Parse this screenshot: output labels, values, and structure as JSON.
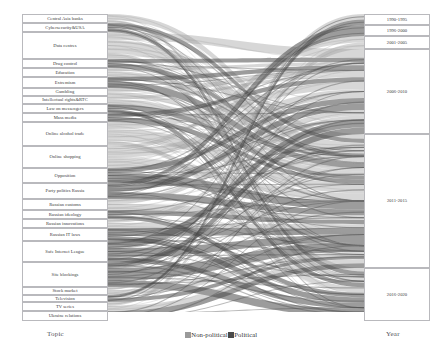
{
  "chart_data": {
    "type": "sankey",
    "title": "",
    "xlabel": "",
    "ylabel": "",
    "left_axis_title": "Topic",
    "right_axis_title": "Year",
    "legend": {
      "position": "bottom-center",
      "entries": [
        {
          "label": "Non-political",
          "color": "#9a9a9a"
        },
        {
          "label": "Political",
          "color": "#4a4a4a"
        }
      ]
    },
    "nodes_left": [
      {
        "label": "Central Asia banks",
        "y": 14,
        "height": 9
      },
      {
        "label": "Cybersecurity&USA",
        "y": 23,
        "height": 9
      },
      {
        "label": "Data centres",
        "y": 32,
        "height": 27
      },
      {
        "label": "Drug control",
        "y": 59,
        "height": 9
      },
      {
        "label": "Education",
        "y": 68,
        "height": 9
      },
      {
        "label": "Extremism",
        "y": 77,
        "height": 11
      },
      {
        "label": "Gambling",
        "y": 88,
        "height": 8
      },
      {
        "label": "Intellectual rights&RTC",
        "y": 96,
        "height": 8
      },
      {
        "label": "Law on messengers",
        "y": 104,
        "height": 9
      },
      {
        "label": "Mass media",
        "y": 113,
        "height": 9
      },
      {
        "label": "Online alcohol trade",
        "y": 122,
        "height": 24
      },
      {
        "label": "Online shopping",
        "y": 146,
        "height": 22
      },
      {
        "label": "Opposition",
        "y": 168,
        "height": 15
      },
      {
        "label": "Party politics Russia",
        "y": 183,
        "height": 16
      },
      {
        "label": "Russian customs",
        "y": 199,
        "height": 11
      },
      {
        "label": "Russian ideology",
        "y": 210,
        "height": 9
      },
      {
        "label": "Russian innovations",
        "y": 219,
        "height": 9
      },
      {
        "label": "Russian IT laws",
        "y": 228,
        "height": 13
      },
      {
        "label": "Safe Internet League",
        "y": 241,
        "height": 21
      },
      {
        "label": "Site blockings",
        "y": 262,
        "height": 25
      },
      {
        "label": "Stock market",
        "y": 287,
        "height": 8
      },
      {
        "label": "Television",
        "y": 295,
        "height": 7
      },
      {
        "label": "TV series",
        "y": 302,
        "height": 9
      },
      {
        "label": "Ukraine relations",
        "y": 311,
        "height": 10
      }
    ],
    "nodes_right": [
      {
        "label": "1990-1995",
        "y": 14,
        "height": 11
      },
      {
        "label": "1996-2000",
        "y": 25,
        "height": 11
      },
      {
        "label": "2001-2005",
        "y": 36,
        "height": 13
      },
      {
        "label": "2006-2010",
        "y": 49,
        "height": 85
      },
      {
        "label": "2011-2015",
        "y": 134,
        "height": 134
      },
      {
        "label": "2016-2020",
        "y": 268,
        "height": 53
      }
    ],
    "flows": [
      {
        "source": "Central Asia banks",
        "target": "2011-2015",
        "value": 6,
        "class": "Non-political"
      },
      {
        "source": "Central Asia banks",
        "target": "2016-2020",
        "value": 3,
        "class": "Non-political"
      },
      {
        "source": "Cybersecurity&USA",
        "target": "2011-2015",
        "value": 5,
        "class": "Political"
      },
      {
        "source": "Cybersecurity&USA",
        "target": "2016-2020",
        "value": 4,
        "class": "Political"
      },
      {
        "source": "Data centres",
        "target": "2006-2010",
        "value": 8,
        "class": "Non-political"
      },
      {
        "source": "Data centres",
        "target": "2011-2015",
        "value": 13,
        "class": "Non-political"
      },
      {
        "source": "Data centres",
        "target": "2016-2020",
        "value": 6,
        "class": "Non-political"
      },
      {
        "source": "Drug control",
        "target": "2006-2010",
        "value": 4,
        "class": "Political"
      },
      {
        "source": "Drug control",
        "target": "2011-2015",
        "value": 5,
        "class": "Political"
      },
      {
        "source": "Education",
        "target": "2006-2010",
        "value": 3,
        "class": "Non-political"
      },
      {
        "source": "Education",
        "target": "2011-2015",
        "value": 6,
        "class": "Non-political"
      },
      {
        "source": "Extremism",
        "target": "2006-2010",
        "value": 4,
        "class": "Political"
      },
      {
        "source": "Extremism",
        "target": "2011-2015",
        "value": 7,
        "class": "Political"
      },
      {
        "source": "Gambling",
        "target": "2006-2010",
        "value": 4,
        "class": "Non-political"
      },
      {
        "source": "Gambling",
        "target": "2011-2015",
        "value": 4,
        "class": "Non-political"
      },
      {
        "source": "Intellectual rights&RTC",
        "target": "2006-2010",
        "value": 3,
        "class": "Non-political"
      },
      {
        "source": "Intellectual rights&RTC",
        "target": "2011-2015",
        "value": 5,
        "class": "Non-political"
      },
      {
        "source": "Law on messengers",
        "target": "2011-2015",
        "value": 5,
        "class": "Political"
      },
      {
        "source": "Law on messengers",
        "target": "2016-2020",
        "value": 4,
        "class": "Political"
      },
      {
        "source": "Mass media",
        "target": "2006-2010",
        "value": 4,
        "class": "Political"
      },
      {
        "source": "Mass media",
        "target": "2011-2015",
        "value": 5,
        "class": "Political"
      },
      {
        "source": "Online alcohol trade",
        "target": "2006-2010",
        "value": 7,
        "class": "Non-political"
      },
      {
        "source": "Online alcohol trade",
        "target": "2011-2015",
        "value": 12,
        "class": "Non-political"
      },
      {
        "source": "Online alcohol trade",
        "target": "2016-2020",
        "value": 5,
        "class": "Non-political"
      },
      {
        "source": "Online shopping",
        "target": "2001-2005",
        "value": 4,
        "class": "Non-political"
      },
      {
        "source": "Online shopping",
        "target": "2006-2010",
        "value": 8,
        "class": "Non-political"
      },
      {
        "source": "Online shopping",
        "target": "2011-2015",
        "value": 10,
        "class": "Non-political"
      },
      {
        "source": "Opposition",
        "target": "2006-2010",
        "value": 5,
        "class": "Political"
      },
      {
        "source": "Opposition",
        "target": "2011-2015",
        "value": 10,
        "class": "Political"
      },
      {
        "source": "Party politics Russia",
        "target": "1996-2000",
        "value": 3,
        "class": "Political"
      },
      {
        "source": "Party politics Russia",
        "target": "2006-2010",
        "value": 6,
        "class": "Political"
      },
      {
        "source": "Party politics Russia",
        "target": "2011-2015",
        "value": 7,
        "class": "Political"
      },
      {
        "source": "Russian customs",
        "target": "2006-2010",
        "value": 5,
        "class": "Non-political"
      },
      {
        "source": "Russian customs",
        "target": "2011-2015",
        "value": 6,
        "class": "Non-political"
      },
      {
        "source": "Russian ideology",
        "target": "2011-2015",
        "value": 5,
        "class": "Political"
      },
      {
        "source": "Russian ideology",
        "target": "2016-2020",
        "value": 4,
        "class": "Political"
      },
      {
        "source": "Russian innovations",
        "target": "2006-2010",
        "value": 4,
        "class": "Non-political"
      },
      {
        "source": "Russian innovations",
        "target": "2011-2015",
        "value": 5,
        "class": "Non-political"
      },
      {
        "source": "Russian IT laws",
        "target": "2011-2015",
        "value": 8,
        "class": "Political"
      },
      {
        "source": "Russian IT laws",
        "target": "2016-2020",
        "value": 5,
        "class": "Political"
      },
      {
        "source": "Safe Internet League",
        "target": "2006-2010",
        "value": 7,
        "class": "Political"
      },
      {
        "source": "Safe Internet League",
        "target": "2011-2015",
        "value": 9,
        "class": "Political"
      },
      {
        "source": "Safe Internet League",
        "target": "2016-2020",
        "value": 5,
        "class": "Political"
      },
      {
        "source": "Site blockings",
        "target": "2006-2010",
        "value": 6,
        "class": "Political"
      },
      {
        "source": "Site blockings",
        "target": "2011-2015",
        "value": 12,
        "class": "Political"
      },
      {
        "source": "Site blockings",
        "target": "2016-2020",
        "value": 7,
        "class": "Political"
      },
      {
        "source": "Stock market",
        "target": "1990-1995",
        "value": 3,
        "class": "Non-political"
      },
      {
        "source": "Stock market",
        "target": "2011-2015",
        "value": 5,
        "class": "Non-political"
      },
      {
        "source": "Television",
        "target": "1990-1995",
        "value": 3,
        "class": "Political"
      },
      {
        "source": "Television",
        "target": "2011-2015",
        "value": 4,
        "class": "Political"
      },
      {
        "source": "TV series",
        "target": "2001-2005",
        "value": 4,
        "class": "Non-political"
      },
      {
        "source": "TV series",
        "target": "2011-2015",
        "value": 5,
        "class": "Non-political"
      },
      {
        "source": "Ukraine relations",
        "target": "2011-2015",
        "value": 6,
        "class": "Political"
      },
      {
        "source": "Ukraine relations",
        "target": "2016-2020",
        "value": 4,
        "class": "Political"
      }
    ]
  }
}
